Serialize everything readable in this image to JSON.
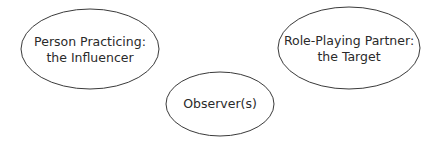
{
  "diagram": {
    "type": "role-play-triad",
    "colors": {
      "stroke": "#3a3a3a",
      "text": "#2a2a2a",
      "background": "#ffffff"
    },
    "nodes": [
      {
        "id": "influencer",
        "line1": "Person Practicing:",
        "line2": "the Influencer",
        "shape": "ellipse",
        "cx": 90,
        "cy": 49,
        "rx": 69,
        "ry": 40
      },
      {
        "id": "target",
        "line1": "Role-Playing Partner:",
        "line2": "the Target",
        "shape": "ellipse",
        "cx": 349,
        "cy": 48,
        "rx": 71,
        "ry": 41
      },
      {
        "id": "observer",
        "line1": "Observer(s)",
        "shape": "ellipse",
        "cx": 220,
        "cy": 104,
        "rx": 54,
        "ry": 32
      }
    ]
  }
}
